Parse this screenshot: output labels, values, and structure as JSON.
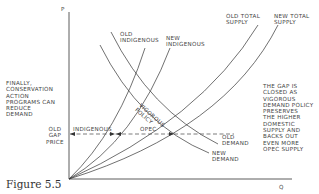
{
  "axes": {
    "y_label": "P",
    "x_label": "Q"
  },
  "curves": {
    "old_indigenous": "OLD\nINDIGENOUS",
    "new_indigenous": "NEW\nINDIGENOUS",
    "old_total_supply": "OLD TOTAL\nSUPPLY",
    "new_total_supply": "NEW TOTAL\nSUPPLY",
    "old_demand": "OLD\nDEMAND",
    "new_demand": "NEW\nDEMAND"
  },
  "annotations": {
    "left_note": "FINALLY,\nCONSERVATION\nACTION\nPROGRAMS CAN\nREDUCE\nDEMAND",
    "gap_price": "OLD\nGAP\nPRICE",
    "indigenous": "INDIGENOUS",
    "opec": "OPEC",
    "vigorous_policy": "VIGOROUS\nPOLICY",
    "right_note": "THE GAP IS\nCLOSED AS\nVIGOROUS\nDEMAND POLICY\nPRESERVES\nTHE HIGHER\nDOMESTIC\nSUPPLY AND\nBACKS OUT\nEVEN MORE\nOPEC SUPPLY"
  },
  "caption": "Figure 5.5",
  "colors": {
    "line": "#333333",
    "text": "#444444"
  }
}
